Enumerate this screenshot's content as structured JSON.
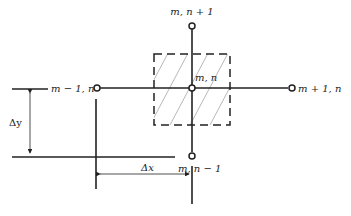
{
  "diagram": {
    "nodes": {
      "center": {
        "label": "m, n"
      },
      "top": {
        "label": "m, n + 1"
      },
      "bottom": {
        "label": "m, n − 1"
      },
      "left": {
        "label": "m − 1, n"
      },
      "right": {
        "label": "m + 1, n"
      }
    },
    "dimensions": {
      "dy": {
        "label": "Δy"
      },
      "dx": {
        "label": "Δx"
      }
    },
    "colors": {
      "line": "#222222",
      "hatch": "#888888",
      "background": "#ffffff"
    }
  }
}
